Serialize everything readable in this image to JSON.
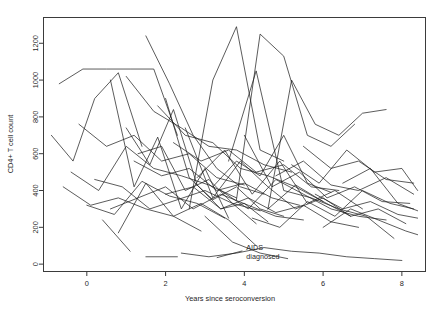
{
  "chart_data": {
    "type": "line",
    "title": "",
    "subtitle": "",
    "xlabel": "Years since seroconversion",
    "ylabel": "CD4+ T cell count",
    "xlim": [
      -1.1,
      8.6
    ],
    "ylim": [
      -40,
      1340
    ],
    "xticks": [
      0,
      2,
      4,
      6,
      8
    ],
    "xtick_labels": [
      "0",
      "2",
      "4",
      "6",
      "8"
    ],
    "yticks": [
      0,
      200,
      400,
      600,
      800,
      1000,
      1200
    ],
    "ytick_labels": [
      "0",
      "200",
      "400",
      "600",
      "800",
      "1000",
      "1200"
    ],
    "grid": false,
    "legend": "none",
    "line_color": "#1c1c1c",
    "frame_color": "#3b3b3b",
    "background": "#ffffff",
    "annotations": [
      {
        "name": "aids-diagnosed-label",
        "text_lines": [
          "AIDS",
          "diagnosed"
        ],
        "x": 4.05,
        "y": 75,
        "leader_from": [
          3.3,
          35
        ],
        "leader_to": [
          3.95,
          72
        ]
      }
    ],
    "series": [
      {
        "name": "subject-01",
        "x": [
          -0.7,
          -0.1,
          0.5,
          1.1,
          1.7,
          2.3
        ],
        "values": [
          980,
          1060,
          1060,
          1060,
          1060,
          700
        ]
      },
      {
        "name": "subject-02",
        "x": [
          -0.9,
          -0.35,
          0.2,
          0.8,
          1.4
        ],
        "values": [
          700,
          560,
          900,
          1040,
          640
        ]
      },
      {
        "name": "subject-03",
        "x": [
          0.6,
          1.2,
          1.8,
          2.4,
          3.0,
          3.6
        ],
        "values": [
          1000,
          420,
          690,
          300,
          520,
          250
        ]
      },
      {
        "name": "subject-04",
        "x": [
          1.5,
          2.1,
          2.7,
          3.3,
          3.9,
          4.5
        ],
        "values": [
          1240,
          980,
          700,
          520,
          420,
          380
        ]
      },
      {
        "name": "subject-05",
        "x": [
          1.0,
          1.6,
          2.2,
          2.8,
          3.4,
          4.0,
          4.6
        ],
        "values": [
          740,
          540,
          840,
          430,
          300,
          330,
          230
        ]
      },
      {
        "name": "subject-06",
        "x": [
          1.3,
          1.9,
          2.5,
          3.1,
          3.7,
          4.3
        ],
        "values": [
          600,
          640,
          400,
          460,
          330,
          220
        ]
      },
      {
        "name": "subject-07",
        "x": [
          2.0,
          2.6,
          3.2,
          3.8,
          4.4,
          5.0
        ],
        "values": [
          900,
          470,
          350,
          420,
          300,
          260
        ]
      },
      {
        "name": "subject-08",
        "x": [
          2.6,
          3.2,
          3.8,
          4.4,
          5.0
        ],
        "values": [
          300,
          1000,
          1290,
          620,
          560
        ]
      },
      {
        "name": "subject-09",
        "x": [
          3.2,
          3.8,
          4.4,
          5.0,
          5.6,
          6.2
        ],
        "values": [
          420,
          560,
          480,
          700,
          440,
          390
        ]
      },
      {
        "name": "subject-10",
        "x": [
          3.8,
          4.4,
          5.0,
          5.6,
          6.2,
          6.8
        ],
        "values": [
          350,
          1250,
          1130,
          700,
          640,
          760
        ]
      },
      {
        "name": "subject-11",
        "x": [
          4.6,
          5.2,
          5.8,
          6.4,
          7.0,
          7.6
        ],
        "values": [
          300,
          1000,
          760,
          700,
          820,
          840
        ]
      },
      {
        "name": "subject-12",
        "x": [
          0.2,
          0.9,
          1.6,
          2.3,
          3.0,
          3.7,
          4.4
        ],
        "values": [
          460,
          420,
          300,
          350,
          400,
          330,
          290
        ]
      },
      {
        "name": "subject-13",
        "x": [
          0.0,
          0.7,
          1.4,
          2.1,
          2.8,
          3.5
        ],
        "values": [
          320,
          270,
          450,
          370,
          330,
          250
        ]
      },
      {
        "name": "subject-14",
        "x": [
          -0.4,
          0.3,
          1.0,
          1.7,
          2.4,
          3.1,
          3.8
        ],
        "values": [
          500,
          400,
          640,
          520,
          480,
          430,
          360
        ]
      },
      {
        "name": "subject-15",
        "x": [
          1.2,
          1.9,
          2.6,
          3.3,
          4.0,
          4.7,
          5.4
        ],
        "values": [
          560,
          480,
          520,
          400,
          440,
          360,
          320
        ]
      },
      {
        "name": "subject-16",
        "x": [
          2.2,
          2.9,
          3.6,
          4.3,
          5.0,
          5.7,
          6.4
        ],
        "values": [
          660,
          560,
          620,
          500,
          540,
          420,
          400
        ]
      },
      {
        "name": "subject-17",
        "x": [
          2.8,
          3.5,
          4.2,
          4.9,
          5.6,
          6.3,
          7.0
        ],
        "values": [
          470,
          620,
          380,
          560,
          330,
          400,
          300
        ]
      },
      {
        "name": "subject-18",
        "x": [
          3.4,
          4.1,
          4.8,
          5.5,
          6.2,
          6.9,
          7.6
        ],
        "values": [
          400,
          300,
          460,
          380,
          300,
          260,
          240
        ]
      },
      {
        "name": "subject-19",
        "x": [
          4.0,
          4.7,
          5.4,
          6.1,
          6.8,
          7.5,
          8.2
        ],
        "values": [
          700,
          420,
          500,
          360,
          420,
          340,
          330
        ]
      },
      {
        "name": "subject-20",
        "x": [
          4.6,
          5.3,
          6.0,
          6.7,
          7.4,
          8.1
        ],
        "values": [
          300,
          430,
          340,
          260,
          300,
          220
        ]
      },
      {
        "name": "subject-21",
        "x": [
          5.2,
          5.9,
          6.6,
          7.3,
          8.0,
          8.4
        ],
        "values": [
          540,
          440,
          620,
          500,
          520,
          400
        ]
      },
      {
        "name": "subject-22",
        "x": [
          5.8,
          6.5,
          7.2,
          7.9,
          8.4
        ],
        "values": [
          380,
          300,
          340,
          270,
          250
        ]
      },
      {
        "name": "subject-23",
        "x": [
          2.4,
          3.1,
          3.8,
          4.5,
          5.2,
          5.9,
          6.6,
          7.3,
          8.0
        ],
        "values": [
          60,
          40,
          60,
          90,
          70,
          60,
          40,
          30,
          20
        ]
      },
      {
        "name": "subject-24",
        "x": [
          0.4,
          1.1
        ],
        "values": [
          240,
          70
        ]
      },
      {
        "name": "subject-25",
        "x": [
          1.5,
          2.3
        ],
        "values": [
          40,
          40
        ]
      },
      {
        "name": "subject-26",
        "x": [
          3.0,
          3.7,
          4.4,
          5.1
        ],
        "values": [
          260,
          120,
          60,
          30
        ]
      },
      {
        "name": "subject-27",
        "x": [
          -0.6,
          0.1,
          0.8,
          1.5,
          2.2,
          2.9
        ],
        "values": [
          420,
          320,
          360,
          300,
          260,
          180
        ]
      },
      {
        "name": "subject-28",
        "x": [
          1.8,
          2.5,
          3.2,
          3.9,
          4.6,
          5.3,
          6.0
        ],
        "values": [
          860,
          700,
          660,
          520,
          480,
          420,
          340
        ]
      },
      {
        "name": "subject-29",
        "x": [
          0.8,
          1.5,
          2.2,
          2.9,
          3.6,
          4.3
        ],
        "values": [
          170,
          440,
          260,
          330,
          240,
          100
        ]
      },
      {
        "name": "subject-30",
        "x": [
          4.2,
          4.9,
          5.6,
          6.3,
          7.0,
          7.7,
          8.3
        ],
        "values": [
          250,
          200,
          340,
          260,
          400,
          330,
          300
        ]
      },
      {
        "name": "subject-31",
        "x": [
          5.5,
          6.2,
          6.9,
          7.6,
          8.3
        ],
        "values": [
          640,
          520,
          560,
          460,
          440
        ]
      },
      {
        "name": "subject-32",
        "x": [
          6.0,
          6.7,
          7.4,
          8.1,
          8.4
        ],
        "values": [
          200,
          300,
          240,
          180,
          160
        ]
      },
      {
        "name": "subject-33",
        "x": [
          2.0,
          2.7,
          3.4,
          4.1,
          4.8,
          5.5,
          6.2,
          6.9
        ],
        "values": [
          380,
          420,
          300,
          360,
          280,
          320,
          230,
          200
        ]
      },
      {
        "name": "subject-34",
        "x": [
          -0.2,
          0.5,
          1.2,
          1.9,
          2.6,
          3.3,
          4.0
        ],
        "values": [
          760,
          640,
          700,
          560,
          600,
          470,
          430
        ]
      },
      {
        "name": "subject-35",
        "x": [
          3.6,
          4.3,
          5.0,
          5.7,
          6.4,
          7.1,
          7.8
        ],
        "values": [
          560,
          1050,
          400,
          360,
          300,
          260,
          140
        ]
      },
      {
        "name": "subject-36",
        "x": [
          1.0,
          1.7,
          2.4,
          3.1,
          3.8,
          4.5,
          5.2
        ],
        "values": [
          1020,
          830,
          740,
          640,
          620,
          540,
          500
        ]
      },
      {
        "name": "subject-37",
        "x": [
          4.8,
          5.5,
          6.2,
          6.9,
          7.6,
          8.3
        ],
        "values": [
          480,
          560,
          430,
          400,
          470,
          380
        ]
      },
      {
        "name": "subject-38",
        "x": [
          0.6,
          1.3,
          2.0,
          2.7,
          3.4,
          4.1,
          4.8,
          5.5
        ],
        "values": [
          300,
          360,
          420,
          300,
          380,
          320,
          260,
          240
        ]
      },
      {
        "name": "subject-39",
        "x": [
          2.5,
          3.2,
          3.9,
          4.6,
          5.3,
          6.0,
          6.7
        ],
        "values": [
          740,
          360,
          560,
          420,
          300,
          360,
          260
        ]
      },
      {
        "name": "subject-40",
        "x": [
          6.5,
          7.2,
          7.9,
          8.4
        ],
        "values": [
          440,
          520,
          330,
          290
        ]
      }
    ]
  }
}
